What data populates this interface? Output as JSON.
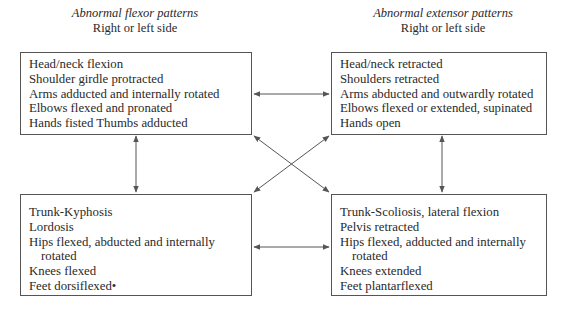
{
  "headings": {
    "left": {
      "title": "Abnormal flexor patterns",
      "subtitle": "Right or left side"
    },
    "right": {
      "title": "Abnormal extensor patterns",
      "subtitle": "Right or left side"
    }
  },
  "boxes": {
    "flexor_upper": {
      "lines": [
        "Head/neck flexion",
        "Shoulder girdle protracted",
        "Arms adducted and internally rotated",
        "Elbows flexed and pronated",
        "Hands fisted Thumbs adducted"
      ]
    },
    "extensor_upper": {
      "lines": [
        "Head/neck retracted",
        "Shoulders retracted",
        "Arms abducted and outwardly rotated",
        "Elbows flexed or extended, supinated",
        "Hands open"
      ]
    },
    "flexor_lower": {
      "lines": [
        "Trunk-Kyphosis",
        "Lordosis",
        "Hips flexed, abducted and internally",
        "rotated",
        "Knees flexed",
        "Feet dorsiflexed•"
      ]
    },
    "extensor_lower": {
      "lines": [
        "Trunk-Scoliosis, lateral flexion",
        "Pelvis retracted",
        "Hips flexed,  adducted and internally",
        "rotated",
        "Knees extended",
        "Feet plantarflexed"
      ]
    }
  },
  "arrows": [
    {
      "from": "flexor_upper",
      "to": "extensor_upper",
      "type": "bidirectional-horizontal"
    },
    {
      "from": "flexor_lower",
      "to": "extensor_lower",
      "type": "bidirectional-horizontal"
    },
    {
      "from": "flexor_upper",
      "to": "flexor_lower",
      "type": "bidirectional-vertical"
    },
    {
      "from": "extensor_upper",
      "to": "extensor_lower",
      "type": "bidirectional-vertical"
    },
    {
      "from": "flexor_upper",
      "to": "extensor_lower",
      "type": "bidirectional-diagonal"
    },
    {
      "from": "extensor_upper",
      "to": "flexor_lower",
      "type": "bidirectional-diagonal"
    }
  ],
  "colors": {
    "line": "#555555",
    "text": "#2a2a2a"
  }
}
